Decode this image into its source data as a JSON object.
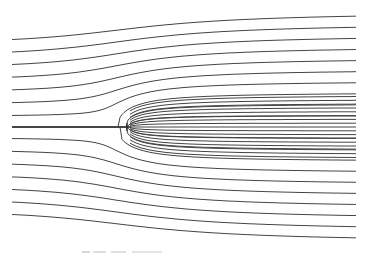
{
  "diagram": {
    "type": "streamlines",
    "colors": {
      "line": "#444444",
      "background": "#ffffff",
      "caption": "#cccccc"
    },
    "plot_area": {
      "x_left": 12,
      "x_right": 356,
      "y_top": 13,
      "y_bottom": 245
    },
    "source_point": {
      "x": 127,
      "y": 127
    },
    "uniform_flow_direction": "left-to-right",
    "left_edge_streamline_y": [
      13,
      25,
      36,
      48,
      61,
      72,
      86,
      98,
      110,
      122,
      135,
      147,
      158,
      170,
      182,
      194,
      206,
      218,
      230,
      242
    ],
    "right_edge_streamline_spacing_px": 8,
    "streamline_count_right": 30
  },
  "caption": {
    "text": "",
    "legible": false
  }
}
